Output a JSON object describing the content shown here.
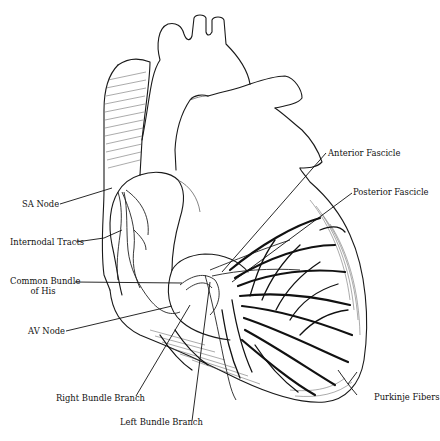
{
  "figure": {
    "labels": {
      "sa_node": "SA Node",
      "internodal_tracts": "Internodal Tracts",
      "common_bundle_line1": "Common Bundle",
      "common_bundle_line2": "of His",
      "av_node": "AV Node",
      "right_bundle_branch": "Right Bundle Branch",
      "left_bundle_branch": "Left Bundle Branch",
      "anterior_fascicle": "Anterior Fascicle",
      "posterior_fascicle": "Posterior Fascicle",
      "purkinje_fibers": "Purkinje Fibers"
    }
  }
}
